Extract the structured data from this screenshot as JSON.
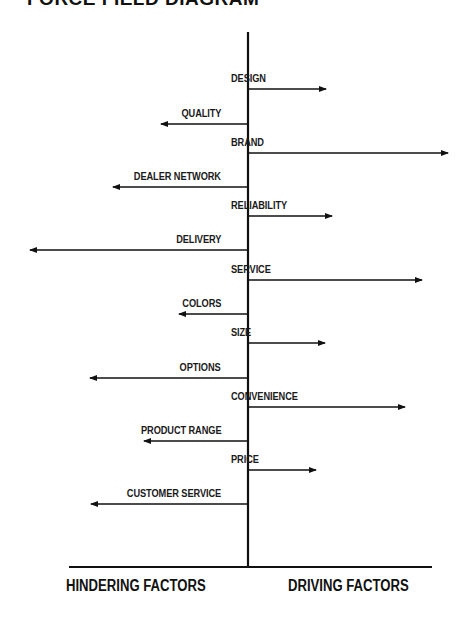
{
  "title": "FORCE FIELD DIAGRAM",
  "axis_labels": {
    "left": "HINDERING FACTORS",
    "right": "DRIVING FACTORS"
  },
  "colors": {
    "line": "#111111",
    "background": "#ffffff"
  },
  "center_x": 248,
  "factors": [
    {
      "label": "DESIGN",
      "side": "driving",
      "y": 89,
      "end_x": 326
    },
    {
      "label": "QUALITY",
      "side": "hindering",
      "y": 124,
      "end_x": 161
    },
    {
      "label": "BRAND",
      "side": "driving",
      "y": 153,
      "end_x": 448
    },
    {
      "label": "DEALER NETWORK",
      "side": "hindering",
      "y": 187,
      "end_x": 113
    },
    {
      "label": "RELIABILITY",
      "side": "driving",
      "y": 216,
      "end_x": 332
    },
    {
      "label": "DELIVERY",
      "side": "hindering",
      "y": 250,
      "end_x": 30
    },
    {
      "label": "SERVICE",
      "side": "driving",
      "y": 280,
      "end_x": 422
    },
    {
      "label": "COLORS",
      "side": "hindering",
      "y": 314,
      "end_x": 179
    },
    {
      "label": "SIZE",
      "side": "driving",
      "y": 343,
      "end_x": 325
    },
    {
      "label": "OPTIONS",
      "side": "hindering",
      "y": 378,
      "end_x": 90
    },
    {
      "label": "CONVENIENCE",
      "side": "driving",
      "y": 407,
      "end_x": 405
    },
    {
      "label": "PRODUCT RANGE",
      "side": "hindering",
      "y": 441,
      "end_x": 144
    },
    {
      "label": "PRICE",
      "side": "driving",
      "y": 470,
      "end_x": 316
    },
    {
      "label": "CUSTOMER SERVICE",
      "side": "hindering",
      "y": 504,
      "end_x": 91
    }
  ]
}
